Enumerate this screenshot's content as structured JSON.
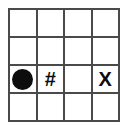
{
  "figure": {
    "name": "grid-symbol-diagram",
    "background_color": "#ffffff",
    "grid_line_color": "#4a4a4a",
    "symbol_color": "#0d0d0d",
    "rows": 4,
    "columns": 4
  },
  "grid": {
    "cells": [
      [
        {
          "symbol": "",
          "kind": "empty"
        },
        {
          "symbol": "",
          "kind": "empty"
        },
        {
          "symbol": "",
          "kind": "empty"
        },
        {
          "symbol": "",
          "kind": "empty"
        }
      ],
      [
        {
          "symbol": "",
          "kind": "empty"
        },
        {
          "symbol": "",
          "kind": "empty"
        },
        {
          "symbol": "",
          "kind": "empty"
        },
        {
          "symbol": "",
          "kind": "empty"
        }
      ],
      [
        {
          "symbol": "●",
          "kind": "circle"
        },
        {
          "symbol": "#",
          "kind": "text"
        },
        {
          "symbol": "",
          "kind": "empty"
        },
        {
          "symbol": "X",
          "kind": "text"
        }
      ],
      [
        {
          "symbol": "",
          "kind": "empty"
        },
        {
          "symbol": "",
          "kind": "empty"
        },
        {
          "symbol": "",
          "kind": "empty"
        },
        {
          "symbol": "",
          "kind": "empty"
        }
      ]
    ]
  }
}
